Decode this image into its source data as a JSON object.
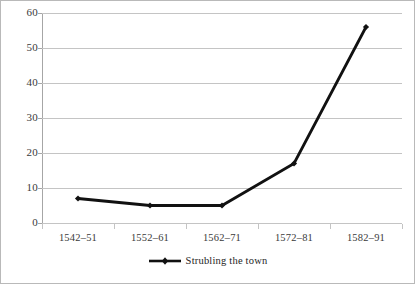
{
  "chart_data": {
    "type": "line",
    "title": "",
    "xlabel": "",
    "ylabel": "",
    "categories": [
      "1542–51",
      "1552–61",
      "1562–71",
      "1572–81",
      "1582–91"
    ],
    "series": [
      {
        "name": "Strubling the town",
        "values": [
          7,
          5,
          5,
          17,
          56
        ],
        "color": "#111111",
        "marker": "diamond"
      }
    ],
    "ylim": [
      0,
      60
    ],
    "yticks": [
      0,
      10,
      20,
      30,
      40,
      50,
      60
    ],
    "ytick_labels": [
      "0",
      "10",
      "20",
      "30",
      "40",
      "50",
      "60"
    ],
    "grid": "horizontal",
    "legend_position": "bottom"
  },
  "legend": {
    "entries": [
      {
        "label": "Strubling the town"
      }
    ]
  },
  "axes": {
    "y_labels": [
      "60",
      "50",
      "40",
      "30",
      "20",
      "10",
      "0"
    ],
    "x_labels": [
      "1542–51",
      "1552–61",
      "1562–71",
      "1572–81",
      "1582–91"
    ]
  },
  "colors": {
    "series": "#111111",
    "grid": "#c4c4c4",
    "axis": "#a6a6a6",
    "text": "#3a3a3a",
    "frame": "#b9b9b9",
    "background": "#ffffff"
  }
}
